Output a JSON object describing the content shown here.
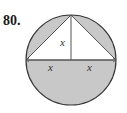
{
  "problem": {
    "number": "80."
  },
  "diagram": {
    "labels": {
      "height": "x",
      "left_half_base": "x",
      "right_half_base": "x"
    },
    "colors": {
      "shade": "#c8c8c8",
      "stroke": "#3a3a3a",
      "background": "#ffffff"
    }
  }
}
